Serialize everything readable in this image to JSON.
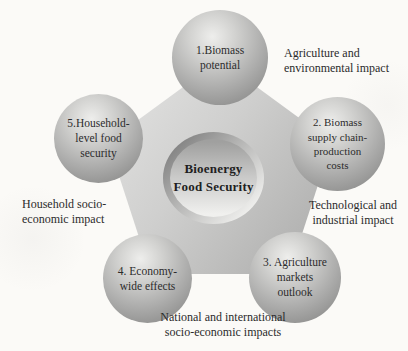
{
  "diagram": {
    "title_context": "Bioenergy and food security pentagon diagram",
    "center": {
      "label": "Bioenergy\nFood Security"
    },
    "nodes": [
      {
        "id": "biomass-potential",
        "label": "1.Biomass\npotential"
      },
      {
        "id": "biomass-supply-chain",
        "label": "2. Biomass\nsupply chain-\nproduction\ncosts"
      },
      {
        "id": "agriculture-markets",
        "label": "3. Agriculture\nmarkets\noutlook"
      },
      {
        "id": "economy-wide-effects",
        "label": "4. Economy-\nwide effects"
      },
      {
        "id": "household-food-security",
        "label": "5.Household-\nlevel food\nsecurity"
      }
    ],
    "outer_labels": [
      {
        "id": "agriculture-environmental",
        "text": "Agriculture and\nenvironmental impact"
      },
      {
        "id": "technological-industrial",
        "text": "Technological and\nindustrial impact"
      },
      {
        "id": "national-international",
        "text": "National and international\nsocio-economic impacts"
      },
      {
        "id": "household-socio-economic",
        "text": "Household socio-\neconomic impact"
      }
    ],
    "colors": {
      "background": "#fbfaf7",
      "pentagon_light": "#e9e9e8",
      "pentagon_dark": "#949493",
      "sphere_highlight": "#eeeeec",
      "sphere_shadow": "#7d7d7c",
      "text": "#2b2b2b"
    }
  }
}
